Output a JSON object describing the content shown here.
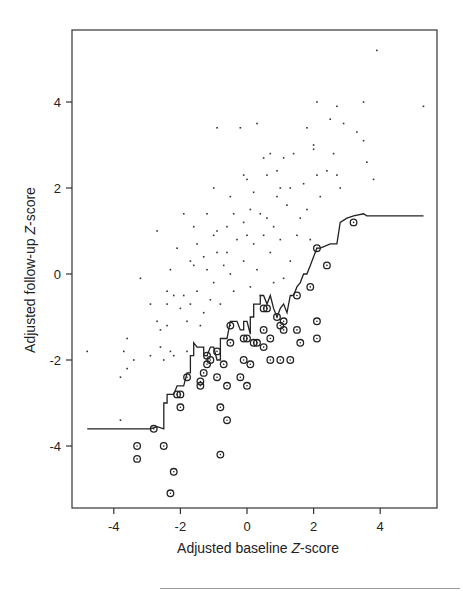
{
  "chart_data": {
    "type": "scatter",
    "title": "",
    "xlabel": "Adjusted baseline Z-score",
    "ylabel": "Adjusted follow-up Z-score",
    "xlabel_parts": [
      "Adjusted baseline ",
      "Z",
      "-score"
    ],
    "ylabel_parts": [
      "Adjusted follow-up ",
      "Z",
      "-score"
    ],
    "xlim": [
      -5.2,
      5.7
    ],
    "ylim": [
      -5.6,
      5.6
    ],
    "xticks": [
      -4,
      -2,
      0,
      2,
      4
    ],
    "yticks": [
      -4,
      -2,
      0,
      2,
      4
    ],
    "grid": false,
    "legend": null,
    "series": [
      {
        "name": "participants",
        "marker": "dot",
        "points": [
          [
            -4.8,
            -1.8
          ],
          [
            -3.8,
            -2.4
          ],
          [
            -3.7,
            -1.8
          ],
          [
            -3.6,
            -1.5
          ],
          [
            -3.6,
            -2.2
          ],
          [
            -3.4,
            -2.0
          ],
          [
            -3.2,
            -0.1
          ],
          [
            -3.8,
            -3.4
          ],
          [
            -2.9,
            -0.7
          ],
          [
            -2.9,
            -1.9
          ],
          [
            -2.7,
            -1.1
          ],
          [
            -2.7,
            1.0
          ],
          [
            -2.6,
            -1.3
          ],
          [
            -2.6,
            -1.7
          ],
          [
            -2.5,
            -2.0
          ],
          [
            -2.4,
            -0.4
          ],
          [
            -2.4,
            -0.7
          ],
          [
            -2.4,
            -1.2
          ],
          [
            -2.3,
            0.1
          ],
          [
            -2.3,
            -1.8
          ],
          [
            -2.2,
            -0.5
          ],
          [
            -2.2,
            -1.9
          ],
          [
            -2.1,
            0.6
          ],
          [
            -2.0,
            -0.8
          ],
          [
            -1.9,
            1.4
          ],
          [
            -1.9,
            -0.5
          ],
          [
            -1.8,
            -1.1
          ],
          [
            -1.8,
            -1.8
          ],
          [
            -1.7,
            0.3
          ],
          [
            -1.7,
            -0.7
          ],
          [
            -1.6,
            1.1
          ],
          [
            -1.6,
            0.2
          ],
          [
            -1.5,
            0.7
          ],
          [
            -1.5,
            -0.4
          ],
          [
            -1.4,
            -1.2
          ],
          [
            -1.3,
            0.4
          ],
          [
            -1.3,
            -0.9
          ],
          [
            -1.2,
            1.4
          ],
          [
            -1.2,
            0.1
          ],
          [
            -1.1,
            -0.6
          ],
          [
            -1.0,
            0.9
          ],
          [
            -1.0,
            2.0
          ],
          [
            -1.0,
            -0.2
          ],
          [
            -0.9,
            3.4
          ],
          [
            -0.9,
            1.0
          ],
          [
            -0.9,
            0.5
          ],
          [
            -0.8,
            -0.7
          ],
          [
            -0.7,
            0.2
          ],
          [
            -0.6,
            1.1
          ],
          [
            -0.6,
            0.5
          ],
          [
            -0.5,
            1.8
          ],
          [
            -0.5,
            0.0
          ],
          [
            -0.4,
            1.4
          ],
          [
            -0.4,
            -0.4
          ],
          [
            -0.3,
            0.8
          ],
          [
            -0.2,
            3.4
          ],
          [
            -0.1,
            2.3
          ],
          [
            -0.1,
            1.2
          ],
          [
            -0.1,
            0.3
          ],
          [
            0.0,
            2.2
          ],
          [
            0.0,
            0.9
          ],
          [
            0.1,
            1.5
          ],
          [
            0.1,
            -0.3
          ],
          [
            0.2,
            0.7
          ],
          [
            0.2,
            1.9
          ],
          [
            0.3,
            3.5
          ],
          [
            0.3,
            0.1
          ],
          [
            0.4,
            1.4
          ],
          [
            0.4,
            -0.5
          ],
          [
            0.5,
            2.7
          ],
          [
            0.5,
            0.9
          ],
          [
            0.6,
            1.3
          ],
          [
            0.6,
            2.3
          ],
          [
            0.7,
            2.8
          ],
          [
            0.7,
            0.5
          ],
          [
            0.8,
            1.1
          ],
          [
            0.8,
            -0.2
          ],
          [
            0.9,
            2.4
          ],
          [
            0.9,
            1.8
          ],
          [
            1.0,
            2.0
          ],
          [
            1.0,
            0.8
          ],
          [
            1.1,
            2.7
          ],
          [
            1.1,
            -0.1
          ],
          [
            1.2,
            1.6
          ],
          [
            1.3,
            2.0
          ],
          [
            1.3,
            0.3
          ],
          [
            1.4,
            2.8
          ],
          [
            1.5,
            0.9
          ],
          [
            1.6,
            1.3
          ],
          [
            1.7,
            2.1
          ],
          [
            1.8,
            3.4
          ],
          [
            1.8,
            1.5
          ],
          [
            1.9,
            0.8
          ],
          [
            2.0,
            3.0
          ],
          [
            2.0,
            2.9
          ],
          [
            2.1,
            4.0
          ],
          [
            2.1,
            2.3
          ],
          [
            2.2,
            1.8
          ],
          [
            2.4,
            2.4
          ],
          [
            2.5,
            3.6
          ],
          [
            2.6,
            2.8
          ],
          [
            2.7,
            3.9
          ],
          [
            2.7,
            2.3
          ],
          [
            2.8,
            2.0
          ],
          [
            2.9,
            3.5
          ],
          [
            3.3,
            3.3
          ],
          [
            3.5,
            3.1
          ],
          [
            3.5,
            4.0
          ],
          [
            3.6,
            2.6
          ],
          [
            3.8,
            2.2
          ],
          [
            3.9,
            5.2
          ],
          [
            5.3,
            3.9
          ]
        ]
      },
      {
        "name": "flagged (circled)",
        "marker": "circle-dot",
        "points": [
          [
            -3.3,
            -4.0
          ],
          [
            -3.3,
            -4.3
          ],
          [
            -2.8,
            -3.6
          ],
          [
            -2.5,
            -4.0
          ],
          [
            -2.3,
            -5.1
          ],
          [
            -2.2,
            -4.6
          ],
          [
            -2.1,
            -2.8
          ],
          [
            -2.0,
            -2.8
          ],
          [
            -2.0,
            -3.1
          ],
          [
            -1.8,
            -2.4
          ],
          [
            -1.4,
            -2.5
          ],
          [
            -1.4,
            -2.6
          ],
          [
            -1.3,
            -2.3
          ],
          [
            -1.2,
            -2.1
          ],
          [
            -1.1,
            -2.0
          ],
          [
            -1.2,
            -1.9
          ],
          [
            -0.9,
            -1.8
          ],
          [
            -0.9,
            -2.4
          ],
          [
            -0.8,
            -3.1
          ],
          [
            -0.8,
            -4.2
          ],
          [
            -0.7,
            -2.1
          ],
          [
            -0.6,
            -3.4
          ],
          [
            -0.6,
            -2.6
          ],
          [
            -0.5,
            -1.2
          ],
          [
            -0.5,
            -1.6
          ],
          [
            -0.2,
            -2.4
          ],
          [
            -0.1,
            -2.0
          ],
          [
            -0.1,
            -1.5
          ],
          [
            0.0,
            -2.6
          ],
          [
            0.0,
            -1.5
          ],
          [
            0.1,
            -2.1
          ],
          [
            0.2,
            -1.6
          ],
          [
            0.3,
            -1.6
          ],
          [
            0.5,
            -1.7
          ],
          [
            0.5,
            -1.3
          ],
          [
            0.5,
            -0.8
          ],
          [
            0.6,
            -0.8
          ],
          [
            0.7,
            -1.5
          ],
          [
            0.7,
            -2.0
          ],
          [
            0.9,
            -1.0
          ],
          [
            1.0,
            -1.2
          ],
          [
            1.0,
            -2.0
          ],
          [
            1.1,
            -1.3
          ],
          [
            1.1,
            -1.1
          ],
          [
            1.3,
            -2.0
          ],
          [
            1.5,
            -1.3
          ],
          [
            1.5,
            -0.5
          ],
          [
            1.6,
            -1.6
          ],
          [
            1.9,
            -0.3
          ],
          [
            2.1,
            -1.1
          ],
          [
            2.1,
            -1.5
          ],
          [
            2.1,
            0.6
          ],
          [
            2.4,
            0.2
          ],
          [
            3.2,
            1.2
          ]
        ]
      }
    ],
    "step_line": {
      "name": "threshold",
      "points": [
        [
          -4.8,
          -3.6
        ],
        [
          -2.9,
          -3.6
        ],
        [
          -2.7,
          -3.55
        ],
        [
          -2.5,
          -3.6
        ],
        [
          -2.5,
          -3.0
        ],
        [
          -2.4,
          -3.0
        ],
        [
          -2.4,
          -2.8
        ],
        [
          -2.2,
          -2.8
        ],
        [
          -2.1,
          -2.6
        ],
        [
          -1.9,
          -2.6
        ],
        [
          -1.8,
          -2.3
        ],
        [
          -1.7,
          -2.3
        ],
        [
          -1.7,
          -1.9
        ],
        [
          -1.6,
          -1.9
        ],
        [
          -1.6,
          -1.6
        ],
        [
          -1.5,
          -1.7
        ],
        [
          -1.3,
          -1.7
        ],
        [
          -1.3,
          -1.9
        ],
        [
          -1.2,
          -1.9
        ],
        [
          -1.1,
          -1.7
        ],
        [
          -1.0,
          -1.7
        ],
        [
          -0.9,
          -2.0
        ],
        [
          -0.8,
          -2.0
        ],
        [
          -0.8,
          -1.5
        ],
        [
          -0.6,
          -1.5
        ],
        [
          -0.5,
          -1.1
        ],
        [
          -0.3,
          -1.1
        ],
        [
          -0.2,
          -1.3
        ],
        [
          -0.1,
          -1.3
        ],
        [
          -0.1,
          -1.1
        ],
        [
          0.0,
          -1.1
        ],
        [
          0.1,
          -1.4
        ],
        [
          0.1,
          -1.0
        ],
        [
          0.2,
          -1.0
        ],
        [
          0.2,
          -0.7
        ],
        [
          0.4,
          -0.7
        ],
        [
          0.4,
          -0.5
        ],
        [
          0.5,
          -0.5
        ],
        [
          0.6,
          -0.7
        ],
        [
          0.7,
          -0.5
        ],
        [
          0.8,
          -0.8
        ],
        [
          0.9,
          -1.0
        ],
        [
          1.0,
          -0.8
        ],
        [
          1.1,
          -0.7
        ],
        [
          1.2,
          -0.9
        ],
        [
          1.3,
          -0.5
        ],
        [
          1.4,
          -0.5
        ],
        [
          1.5,
          -0.3
        ],
        [
          1.6,
          -0.2
        ],
        [
          1.7,
          0.0
        ],
        [
          1.8,
          0.0
        ],
        [
          1.9,
          0.2
        ],
        [
          2.0,
          0.4
        ],
        [
          2.1,
          0.6
        ],
        [
          2.2,
          0.6
        ],
        [
          2.5,
          0.7
        ],
        [
          2.7,
          0.7
        ],
        [
          2.8,
          1.2
        ],
        [
          3.0,
          1.3
        ],
        [
          3.2,
          1.35
        ],
        [
          3.5,
          1.4
        ],
        [
          3.6,
          1.35
        ],
        [
          5.3,
          1.35
        ]
      ]
    }
  }
}
